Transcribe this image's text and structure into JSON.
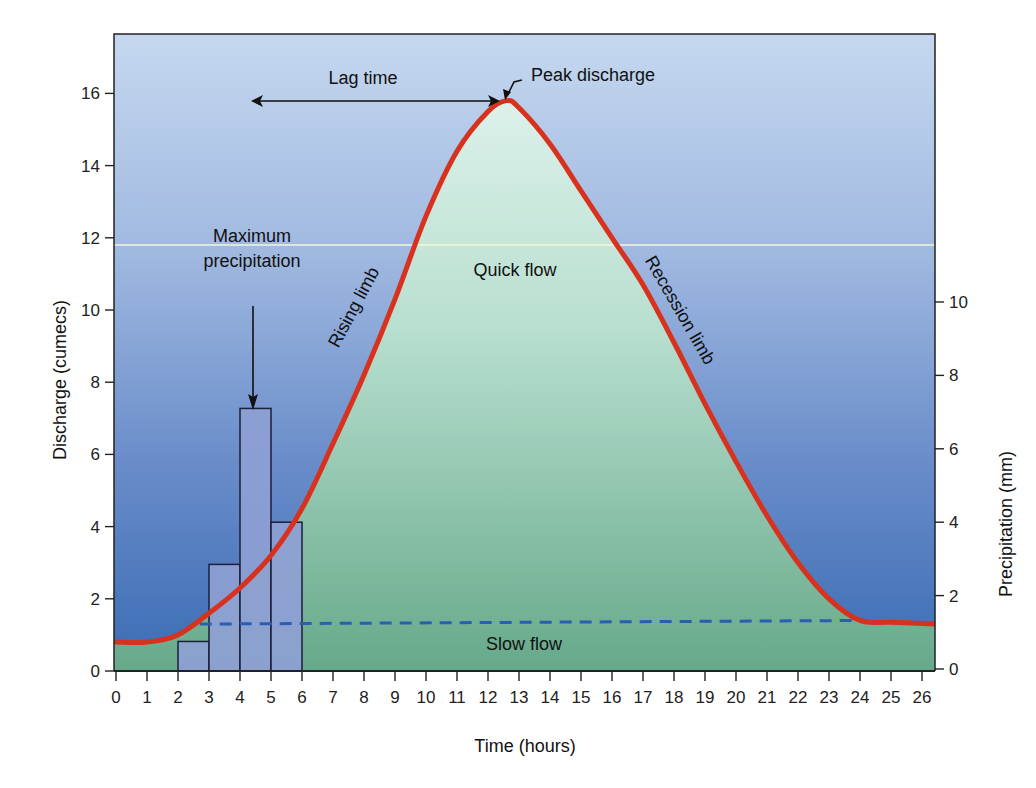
{
  "chart_data": {
    "type": "line",
    "title": "",
    "xlabel": "Time (hours)",
    "ylabel": "Discharge (cumecs)",
    "y2label": "Precipitation (mm)",
    "xlim": [
      0,
      26.5
    ],
    "ylim": [
      0,
      17.5
    ],
    "y2lim": [
      0,
      17.5
    ],
    "x_ticks": [
      0,
      1,
      2,
      3,
      4,
      5,
      6,
      7,
      8,
      9,
      10,
      11,
      12,
      13,
      14,
      15,
      16,
      17,
      18,
      19,
      20,
      21,
      22,
      23,
      24,
      25,
      26
    ],
    "y_ticks": [
      0,
      2,
      4,
      6,
      8,
      10,
      12,
      14,
      16
    ],
    "y2_ticks": [
      0,
      2,
      4,
      6,
      8,
      10
    ],
    "grid": false,
    "series": [
      {
        "name": "Discharge (hydrograph)",
        "type": "line",
        "color": "#d8321e",
        "x": [
          0,
          1,
          2,
          3,
          4,
          5,
          6,
          7,
          8,
          9,
          10,
          11,
          12,
          12.6,
          13,
          14,
          15,
          16,
          17,
          18,
          19,
          20,
          21,
          22,
          23,
          24,
          25,
          26.5
        ],
        "y": [
          0.8,
          0.8,
          1.0,
          1.6,
          2.3,
          3.2,
          4.5,
          6.3,
          8.2,
          10.3,
          12.6,
          14.4,
          15.5,
          15.8,
          15.6,
          14.6,
          13.3,
          12.0,
          10.7,
          9.1,
          7.4,
          5.8,
          4.3,
          3.0,
          2.0,
          1.4,
          1.35,
          1.3
        ]
      },
      {
        "name": "Baseflow separation (slow flow)",
        "type": "dashed-line",
        "color": "#2a5fb0",
        "x": [
          2.7,
          24.2
        ],
        "y": [
          1.3,
          1.4
        ]
      },
      {
        "name": "Precipitation",
        "type": "bar",
        "axis": "y2",
        "bins": [
          [
            2,
            3
          ],
          [
            3,
            4
          ],
          [
            4,
            5
          ],
          [
            5,
            6
          ]
        ],
        "values": [
          0.75,
          2.85,
          7.1,
          4.0
        ]
      }
    ],
    "annotations": [
      {
        "text": "Lag time",
        "type": "double-arrow",
        "from_x": 4.5,
        "to_x": 12.6,
        "y": 15.8
      },
      {
        "text": "Peak discharge",
        "x": 12.6,
        "y": 15.8
      },
      {
        "text": "Maximum precipitation",
        "x": 4.5,
        "arrow_to_y": 7.1
      },
      {
        "text": "Rising limb"
      },
      {
        "text": "Recession limb"
      },
      {
        "text": "Quick flow"
      },
      {
        "text": "Slow flow"
      }
    ]
  },
  "labels": {
    "xlabel": "Time (hours)",
    "ylabel": "Discharge (cumecs)",
    "y2label": "Precipitation (mm)",
    "lag_time": "Lag time",
    "peak_discharge": "Peak discharge",
    "max_precip_1": "Maximum",
    "max_precip_2": "precipitation",
    "rising_limb": "Rising limb",
    "recession_limb": "Recession limb",
    "quick_flow": "Quick flow",
    "slow_flow": "Slow flow"
  },
  "colors": {
    "curve": "#d8321e",
    "baseflow": "#2a5fb0",
    "bg_top": "#c3d6ee",
    "bg_bottom": "#3d6fb6",
    "fill_top": "#d7efe6",
    "fill_bottom": "#6aab8c",
    "bar_fill": "#8e9fd4"
  }
}
